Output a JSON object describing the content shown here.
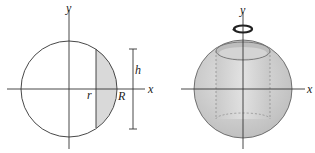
{
  "left_figure": {
    "axis_x_label": "x",
    "axis_y_label": "y",
    "inner_radius_label": "r",
    "outer_radius_label": "R",
    "height_label": "h",
    "shade_color": "#d9d9d9"
  },
  "right_figure": {
    "axis_x_label": "x",
    "axis_y_label": "y",
    "sphere_color": "#cfcfcf",
    "rotation_icon": "rotation-arrow-icon"
  },
  "colors": {
    "stroke": "#333333"
  }
}
